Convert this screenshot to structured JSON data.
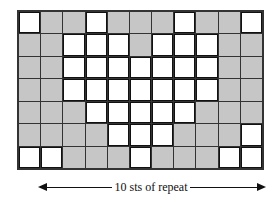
{
  "chart": {
    "columns": 11,
    "rows": 7,
    "colors": {
      "shaded": "#c6c6c6",
      "unshaded": "#ffffff",
      "grid_line": "#333333"
    },
    "cells": [
      [
        "W",
        "G",
        "G",
        "W",
        "G",
        "G",
        "G",
        "W",
        "G",
        "G",
        "W"
      ],
      [
        "G",
        "G",
        "W",
        "W",
        "W",
        "G",
        "W",
        "W",
        "W",
        "G",
        "G"
      ],
      [
        "G",
        "G",
        "W",
        "W",
        "W",
        "W",
        "W",
        "W",
        "W",
        "G",
        "G"
      ],
      [
        "G",
        "G",
        "W",
        "W",
        "W",
        "W",
        "W",
        "W",
        "W",
        "G",
        "G"
      ],
      [
        "G",
        "G",
        "G",
        "W",
        "W",
        "W",
        "W",
        "W",
        "G",
        "G",
        "G"
      ],
      [
        "G",
        "G",
        "G",
        "G",
        "W",
        "W",
        "W",
        "G",
        "G",
        "G",
        "W"
      ],
      [
        "W",
        "W",
        "G",
        "G",
        "G",
        "W",
        "G",
        "G",
        "G",
        "W",
        "W"
      ]
    ]
  },
  "repeat_label": "10 sts of repeat"
}
